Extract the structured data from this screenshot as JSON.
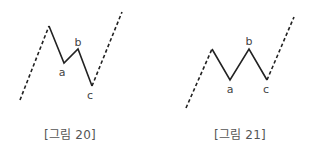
{
  "colors": {
    "line": "#222222",
    "label": "#444444",
    "caption": "#555555",
    "background": "#ffffff"
  },
  "figures": [
    {
      "caption": "[그림 20]",
      "caption_x": 70,
      "lead_in": {
        "from": [
          20,
          100
        ],
        "to": [
          49,
          26
        ],
        "style": "dashed"
      },
      "solid_path": [
        [
          49,
          26
        ],
        [
          64,
          63
        ],
        [
          78,
          49
        ],
        [
          92,
          86
        ]
      ],
      "lead_out": {
        "from": [
          92,
          86
        ],
        "to": [
          122,
          12
        ],
        "style": "dashed"
      },
      "points": [
        {
          "label": "a",
          "x": 64,
          "y": 63,
          "label_x": 62,
          "label_y": 76
        },
        {
          "label": "b",
          "x": 78,
          "y": 49,
          "label_x": 78,
          "label_y": 46
        },
        {
          "label": "c",
          "x": 92,
          "y": 86,
          "label_x": 90,
          "label_y": 99
        }
      ]
    },
    {
      "caption": "[그림 21]",
      "caption_x": 240,
      "lead_in": {
        "from": [
          186,
          108
        ],
        "to": [
          212,
          49
        ],
        "style": "dashed"
      },
      "solid_path": [
        [
          212,
          49
        ],
        [
          230,
          80
        ],
        [
          249,
          49
        ],
        [
          267,
          80
        ]
      ],
      "lead_out": {
        "from": [
          267,
          80
        ],
        "to": [
          294,
          17
        ],
        "style": "dashed"
      },
      "points": [
        {
          "label": "a",
          "x": 230,
          "y": 80,
          "label_x": 230,
          "label_y": 93
        },
        {
          "label": "b",
          "x": 249,
          "y": 49,
          "label_x": 249,
          "label_y": 45
        },
        {
          "label": "c",
          "x": 267,
          "y": 80,
          "label_x": 266,
          "label_y": 93
        }
      ]
    }
  ]
}
